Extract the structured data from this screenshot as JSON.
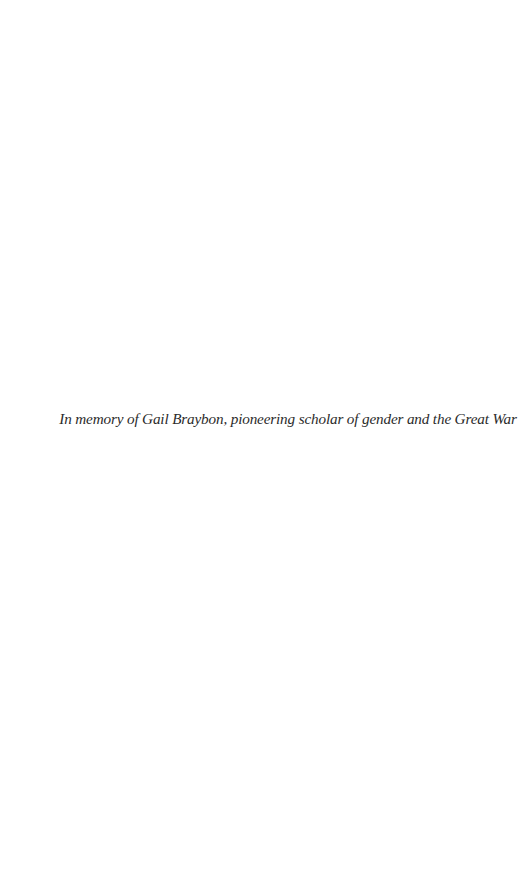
{
  "page": {
    "type": "dedication",
    "dedication_text": "In memory of Gail Braybon, pioneering scholar of gender and the Great War"
  }
}
